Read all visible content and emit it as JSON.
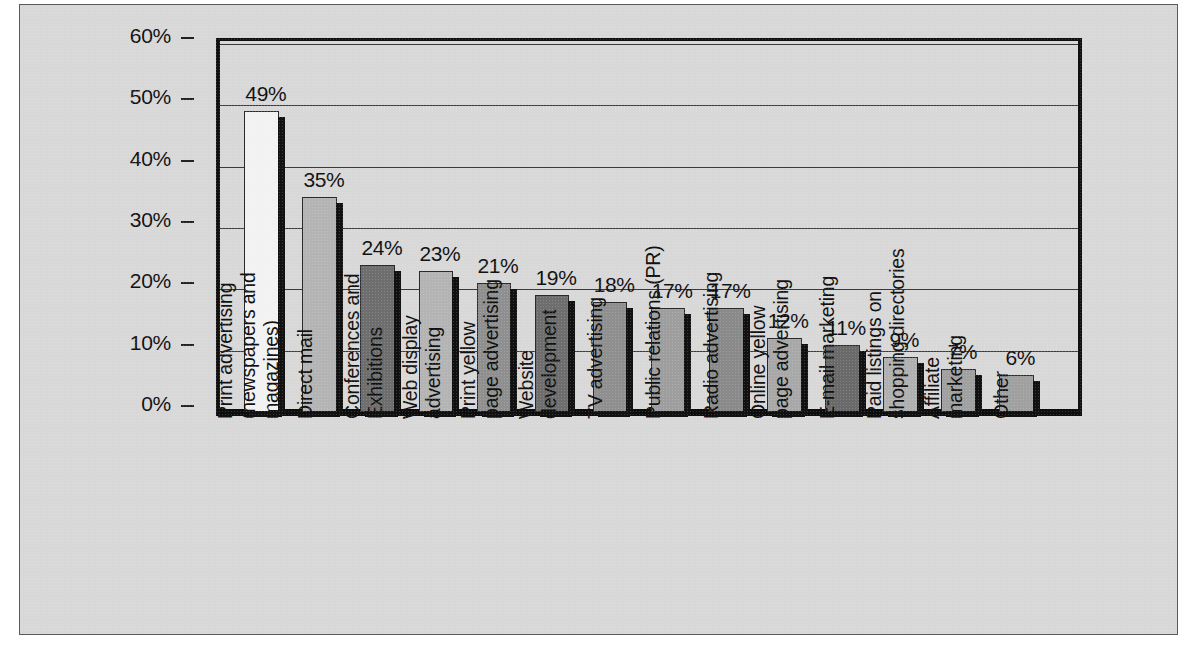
{
  "chart_data": {
    "type": "bar",
    "title": "",
    "xlabel": "",
    "ylabel": "",
    "ylim": [
      0,
      60
    ],
    "ytick_labels": [
      "0%",
      "10%",
      "20%",
      "30%",
      "40%",
      "50%",
      "60%"
    ],
    "ytick_values": [
      0,
      10,
      20,
      30,
      40,
      50,
      60
    ],
    "grid": true,
    "legend": "none",
    "categories": [
      "Print advertising\n(newspapers and\nmagazines)",
      "Direct mail",
      "Conferences and\nExhibitions",
      "Web display\nadvertising",
      "Print yellow\npage advertising",
      "Website\ndevelopment",
      "TV advertising",
      "Public relations (PR)",
      "Radio advertising",
      "Online yellow\npage advertising",
      "E-mail marketing",
      "Paid listings on\nshopping directories",
      "Affiliate\nmarketing",
      "Other"
    ],
    "bars": [
      {
        "label": "Print advertising\n(newspapers and\nmagazines)",
        "value": 49,
        "value_label": "49%",
        "fill": "#f2f2f2"
      },
      {
        "label": "Direct mail",
        "value": 35,
        "value_label": "35%",
        "fill": "#b4b4b4"
      },
      {
        "label": "Conferences and\nExhibitions",
        "value": 24,
        "value_label": "24%",
        "fill": "#6e6e6e"
      },
      {
        "label": "Web display\nadvertising",
        "value": 23,
        "value_label": "23%",
        "fill": "#b4b4b4"
      },
      {
        "label": "Print yellow\npage advertising",
        "value": 21,
        "value_label": "21%",
        "fill": "#8f8f8f"
      },
      {
        "label": "Website\ndevelopment",
        "value": 19,
        "value_label": "19%",
        "fill": "#6e6e6e"
      },
      {
        "label": "TV advertising",
        "value": 18,
        "value_label": "18%",
        "fill": "#8f8f8f"
      },
      {
        "label": "Public relations (PR)",
        "value": 17,
        "value_label": "17%",
        "fill": "#9e9e9e"
      },
      {
        "label": "Radio advertising",
        "value": 17,
        "value_label": "17%",
        "fill": "#8a8a8a"
      },
      {
        "label": "Online yellow\npage advertising",
        "value": 12,
        "value_label": "12%",
        "fill": "#a8a8a8"
      },
      {
        "label": "E-mail marketing",
        "value": 11,
        "value_label": "11%",
        "fill": "#6a6a6a"
      },
      {
        "label": "Paid listings on\nshopping directories",
        "value": 9,
        "value_label": "9%",
        "fill": "#b0b0b0"
      },
      {
        "label": "Affiliate\nmarketing",
        "value": 7,
        "value_label": "7%",
        "fill": "#a0a0a0"
      },
      {
        "label": "Other",
        "value": 6,
        "value_label": "6%",
        "fill": "#a0a0a0"
      }
    ],
    "colors": {
      "plot_background": "#d8d8d8",
      "axis": "#111111",
      "gridline": "#3a3a3a",
      "text": "#111111"
    }
  }
}
